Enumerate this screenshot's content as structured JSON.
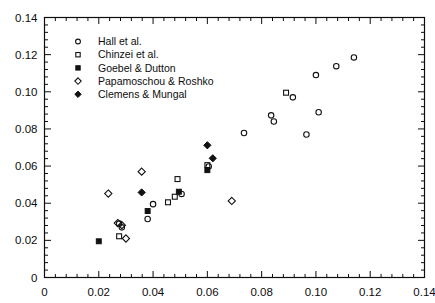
{
  "figure": {
    "background": "#ffffff",
    "ink": "#111111",
    "width": 435,
    "height": 303
  },
  "chart_data": {
    "type": "scatter",
    "title": "",
    "xlabel": "",
    "ylabel": "",
    "xlim": [
      0,
      0.14
    ],
    "ylim": [
      0,
      0.14
    ],
    "grid": false,
    "legend_position": "upper-left",
    "xticks": [
      "0",
      "0.02",
      "0.04",
      "0.06",
      "0.08",
      "0.10",
      "0.12",
      "0.14"
    ],
    "xtick_values": [
      0,
      0.02,
      0.04,
      0.06,
      0.08,
      0.1,
      0.12,
      0.14
    ],
    "yticks": [
      "0",
      "0.02",
      "0.04",
      "0.06",
      "0.08",
      "0.10",
      "0.12",
      "0.14"
    ],
    "ytick_values": [
      0,
      0.02,
      0.04,
      0.06,
      0.08,
      0.1,
      0.12,
      0.14
    ],
    "minor_ticks_per_interval": 4,
    "series": [
      {
        "name": "Hall et al.",
        "marker": "open-circle",
        "color": "#111111",
        "points": [
          [
            0.0275,
            0.029
          ],
          [
            0.0285,
            0.027
          ],
          [
            0.038,
            0.0315
          ],
          [
            0.04,
            0.0395
          ],
          [
            0.0505,
            0.045
          ],
          [
            0.0605,
            0.0598
          ],
          [
            0.0735,
            0.0778
          ],
          [
            0.0835,
            0.0873
          ],
          [
            0.0845,
            0.084
          ],
          [
            0.0915,
            0.097
          ],
          [
            0.0965,
            0.077
          ],
          [
            0.1,
            0.109
          ],
          [
            0.101,
            0.089
          ],
          [
            0.1075,
            0.1138
          ],
          [
            0.114,
            0.1185
          ]
        ]
      },
      {
        "name": "Chinzei et al.",
        "marker": "open-square",
        "color": "#111111",
        "points": [
          [
            0.0275,
            0.0222
          ],
          [
            0.0455,
            0.0405
          ],
          [
            0.048,
            0.0435
          ],
          [
            0.049,
            0.053
          ],
          [
            0.06,
            0.0605
          ],
          [
            0.089,
            0.0995
          ]
        ]
      },
      {
        "name": "Goebel & Dutton",
        "marker": "filled-square",
        "color": "#111111",
        "points": [
          [
            0.02,
            0.0195
          ],
          [
            0.038,
            0.0358
          ],
          [
            0.0495,
            0.0462
          ],
          [
            0.06,
            0.0578
          ]
        ]
      },
      {
        "name": "Papamoschou & Roshko",
        "marker": "open-diamond",
        "color": "#111111",
        "points": [
          [
            0.0235,
            0.0452
          ],
          [
            0.027,
            0.0293
          ],
          [
            0.0285,
            0.0282
          ],
          [
            0.03,
            0.021
          ],
          [
            0.0358,
            0.057
          ],
          [
            0.069,
            0.0412
          ]
        ]
      },
      {
        "name": "Clemens & Mungal",
        "marker": "filled-diamond",
        "color": "#111111",
        "points": [
          [
            0.0358,
            0.0458
          ],
          [
            0.06,
            0.0712
          ],
          [
            0.062,
            0.0642
          ]
        ]
      }
    ]
  },
  "legend": {
    "entries": [
      {
        "label": "Hall et al.",
        "marker": "open-circle"
      },
      {
        "label": "Chinzei et al.",
        "marker": "open-square"
      },
      {
        "label": "Goebel & Dutton",
        "marker": "filled-square"
      },
      {
        "label": "Papamoschou & Roshko",
        "marker": "open-diamond"
      },
      {
        "label": "Clemens & Mungal",
        "marker": "filled-diamond"
      }
    ]
  }
}
